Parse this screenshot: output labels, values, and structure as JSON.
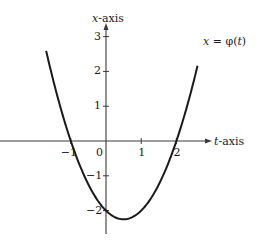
{
  "chart_data": {
    "type": "line",
    "title": "",
    "xlabel": "t-axis",
    "ylabel": "x-axis",
    "xlabel_var": "t",
    "ylabel_var": "x",
    "axis_suffix": "-axis",
    "curve_label": "x = φ(t)",
    "curve_label_parts": {
      "lhs": "x",
      "eq": " = φ(",
      "arg": "t",
      "close": ")"
    },
    "function": "x = t^2 - t - 2",
    "x_ticks": [
      -1,
      0,
      1,
      2
    ],
    "x_tick_labels": [
      "−1",
      "0",
      "1",
      "2"
    ],
    "y_ticks": [
      -2,
      -1,
      1,
      2,
      3
    ],
    "y_tick_labels": [
      "−2",
      "−1",
      "1",
      "2",
      "3"
    ],
    "xlim": [
      -2.9,
      4.3
    ],
    "ylim": [
      -2.8,
      3.3
    ],
    "grid": false,
    "legend": "none",
    "series": [
      {
        "name": "x = φ(t)",
        "t": [
          -1.7,
          -1.5,
          -1.0,
          -0.5,
          0.0,
          0.5,
          1.0,
          1.5,
          2.0,
          2.5,
          2.6
        ],
        "x": [
          2.59,
          1.75,
          0.0,
          -1.25,
          -2.0,
          -2.25,
          -2.0,
          -1.25,
          0.0,
          1.75,
          2.16
        ]
      }
    ],
    "colors": {
      "axis": "#3a3a3a",
      "curve": "#1a1a1a",
      "text": "#1a1a1a",
      "background": "#ffffff"
    }
  }
}
